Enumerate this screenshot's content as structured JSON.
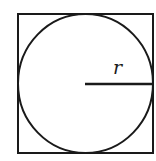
{
  "diagram": {
    "stroke_color": "#1a1a1a",
    "background": "#ffffff",
    "square": {
      "x": 18,
      "y": 14,
      "size": 135
    },
    "circle": {
      "cx": 85.5,
      "cy": 84,
      "r": 67.5
    },
    "radius_line": {
      "x1": 85,
      "y1": 84,
      "x2": 153,
      "y2": 84
    },
    "labels": {
      "radius": "r"
    }
  }
}
